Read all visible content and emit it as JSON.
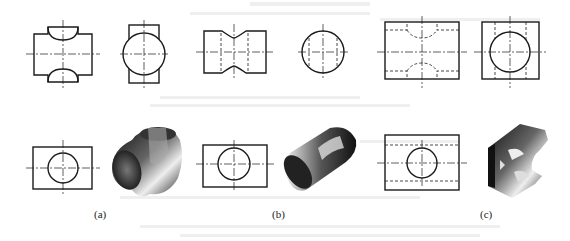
{
  "figure": {
    "panels": [
      {
        "id": "a",
        "label": "(a)",
        "views": [
          "front view: rectangle with two arc-shaped cutouts (top and bottom tabs)",
          "side view: circle over narrow rectangle",
          "bottom view: rectangle with centered circle"
        ],
        "solid": "cross-shaped pipe junction (two perpendicular cylinders)"
      },
      {
        "id": "b",
        "label": "(b)",
        "views": [
          "front view: waisted rectangle with dashed hidden lines",
          "side view: circle with dashed vertical lines",
          "bottom view: rectangle with centered circle"
        ],
        "solid": "cylinder with curved groove cut"
      },
      {
        "id": "c",
        "label": "(c)",
        "views": [
          "front view: rectangle with dashed hidden arcs top and bottom",
          "side view: square with inscribed circle and dashed verticals",
          "bottom view: rectangle with circle and dashed horizontal lines"
        ],
        "solid": "block with cylindrical cutouts"
      }
    ],
    "colors": {
      "line": "#1a1a1a",
      "centerline": "#333333",
      "background": "#ffffff",
      "ghost_text": "#ececec"
    }
  }
}
